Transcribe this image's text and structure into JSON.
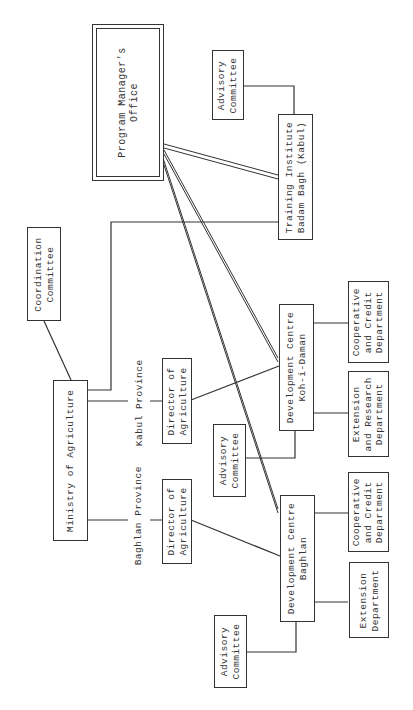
{
  "diagram": {
    "type": "organization-chart",
    "orientation": "rotated-90-ccw",
    "nodes": {
      "program_manager": "Program Manager's\nOffice",
      "advisory_training": "Advisory\nCommittee",
      "training_institute": "Training Institute\nBadam Bagh (Kabul)",
      "coordination": "Coordination\nCommittee",
      "ministry": "Ministry of Agriculture",
      "director_kabul": "Director of\nAgriculture",
      "director_baghlan": "Director of\nAgriculture",
      "dc_koh": "Development Centre\nKoh-i-Daman",
      "dc_baghlan": "Development Centre\nBaghlan",
      "coop_koh": "Cooperative\nand Credit\nDepartment",
      "ext_research_koh": "Extension\nand Research\nDepartment",
      "advisory_koh": "Advisory\nCommittee",
      "coop_baghlan": "Cooperative\nand Credit\nDepartment",
      "ext_baghlan": "Extension\nDepartment",
      "advisory_baghlan": "Advisory\nCommittee"
    },
    "labels": {
      "kabul_province": "Kabul Province",
      "baghlan_province": "Baghlan Province"
    },
    "edges": [
      [
        "ministry",
        "coordination"
      ],
      [
        "ministry",
        "training_institute"
      ],
      [
        "ministry",
        "director_kabul",
        "Kabul Province"
      ],
      [
        "ministry",
        "director_baghlan",
        "Baghlan Province"
      ],
      [
        "director_kabul",
        "dc_koh"
      ],
      [
        "director_baghlan",
        "dc_baghlan"
      ],
      [
        "program_manager",
        "training_institute",
        "double"
      ],
      [
        "program_manager",
        "dc_koh",
        "double"
      ],
      [
        "program_manager",
        "dc_baghlan",
        "double"
      ],
      [
        "advisory_training",
        "training_institute"
      ],
      [
        "dc_koh",
        "coop_koh"
      ],
      [
        "dc_koh",
        "ext_research_koh"
      ],
      [
        "dc_koh",
        "advisory_koh"
      ],
      [
        "dc_baghlan",
        "coop_baghlan"
      ],
      [
        "dc_baghlan",
        "ext_baghlan"
      ],
      [
        "dc_baghlan",
        "advisory_baghlan"
      ]
    ]
  }
}
